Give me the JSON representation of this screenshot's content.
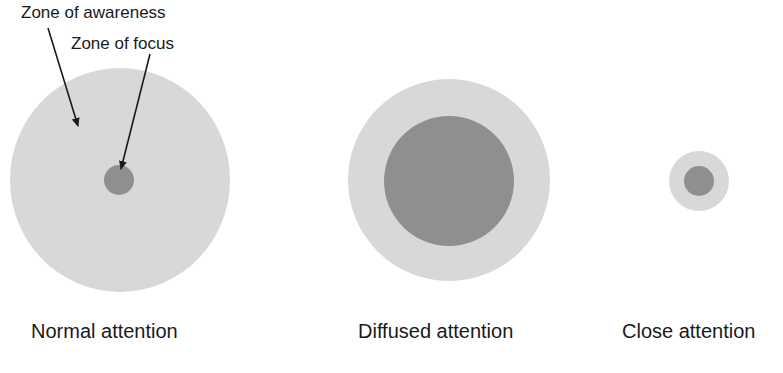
{
  "annotations": {
    "zone_of_awareness": "Zone of awareness",
    "zone_of_focus": "Zone of focus"
  },
  "panels": [
    {
      "label": "Normal attention"
    },
    {
      "label": "Diffused attention"
    },
    {
      "label": "Close attention"
    }
  ],
  "colors": {
    "awareness_zone": "#d8d8d8",
    "focus_zone": "#8f8f8f",
    "arrow": "#1a1a1a",
    "text": "#1a1a1a"
  }
}
